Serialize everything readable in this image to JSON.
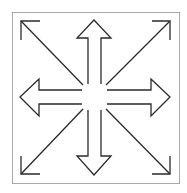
{
  "diagram": {
    "frame": {
      "x": 12,
      "y": 12,
      "width": 167,
      "height": 171,
      "stroke": "#a8a8a8"
    },
    "stroke_color": "#2a2a2a",
    "fill_color": "#ffffff",
    "arrows": [
      {
        "name": "up",
        "style": "block"
      },
      {
        "name": "down",
        "style": "block"
      },
      {
        "name": "left",
        "style": "block"
      },
      {
        "name": "right",
        "style": "block"
      },
      {
        "name": "up-left",
        "style": "line-chevron"
      },
      {
        "name": "up-right",
        "style": "line-chevron"
      },
      {
        "name": "down-left",
        "style": "line-chevron"
      },
      {
        "name": "down-right",
        "style": "line-chevron"
      }
    ]
  }
}
